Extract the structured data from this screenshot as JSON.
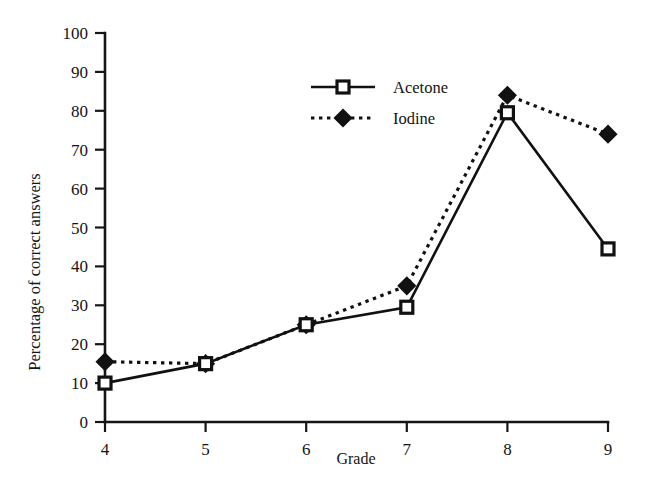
{
  "chart_data": {
    "type": "line",
    "title": "",
    "xlabel": "Grade",
    "ylabel": "Percentage of correct answers",
    "categories": [
      4,
      5,
      6,
      7,
      8,
      9
    ],
    "x": [
      4,
      5,
      6,
      7,
      8,
      9
    ],
    "xlim": [
      4,
      9
    ],
    "ylim": [
      0,
      100
    ],
    "xticks": [
      "4",
      "5",
      "6",
      "7",
      "8",
      "9"
    ],
    "yticks": [
      "0",
      "10",
      "20",
      "30",
      "40",
      "50",
      "60",
      "70",
      "80",
      "90",
      "100"
    ],
    "grid": false,
    "legend_position": "top-center",
    "series": [
      {
        "name": "Acetone",
        "values": [
          10,
          15,
          25,
          29.5,
          79.5,
          44.5
        ],
        "line_style": "solid",
        "marker": "open-square",
        "color": "#111111"
      },
      {
        "name": "Iodine",
        "values": [
          15.5,
          15,
          25,
          35,
          84,
          74
        ],
        "line_style": "dotted",
        "marker": "filled-diamond",
        "color": "#111111"
      }
    ]
  },
  "axes": {
    "y_title": "Percentage of correct answers",
    "x_title": "Grade",
    "y_tick_labels": [
      "100",
      "90",
      "80",
      "70",
      "60",
      "50",
      "40",
      "30",
      "20",
      "10",
      "0"
    ],
    "x_tick_labels": [
      "4",
      "5",
      "6",
      "7",
      "8",
      "9"
    ]
  },
  "legend": {
    "entries": [
      {
        "label": "Acetone",
        "style": "solid-line-open-square"
      },
      {
        "label": "Iodine",
        "style": "dotted-line-filled-diamond"
      }
    ]
  },
  "colors": {
    "ink": "#111111",
    "background": "#ffffff"
  }
}
